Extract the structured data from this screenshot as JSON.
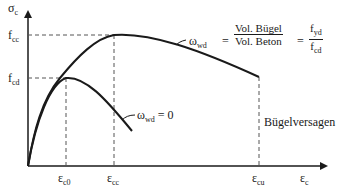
{
  "diagram": {
    "type": "stress-strain curve (confined vs unconfined concrete)",
    "axes": {
      "y_label": "σ",
      "y_label_sub": "c",
      "x_label": "ε",
      "x_label_sub": "c"
    },
    "y_ticks": [
      {
        "label": "f",
        "sub": "cc"
      },
      {
        "label": "f",
        "sub": "cd"
      }
    ],
    "x_ticks": [
      {
        "label": "ε",
        "sub": "c0"
      },
      {
        "label": "ε",
        "sub": "cc"
      },
      {
        "label": "ε",
        "sub": "cu"
      }
    ],
    "curves": [
      {
        "name": "confined",
        "label_symbol": "ω",
        "label_sub": "wd",
        "equals": "=",
        "fraction1_num": "Vol. Bügel",
        "fraction1_den": "Vol. Beton",
        "equals2": "=",
        "fraction2_num_main": "f",
        "fraction2_num_sub": "yd",
        "fraction2_den_main": "f",
        "fraction2_den_sub": "cd"
      },
      {
        "name": "unconfined",
        "label_symbol": "ω",
        "label_sub": "wd",
        "value": "= 0"
      }
    ],
    "annotation": "Bügelversagen",
    "colors": {
      "line": "#1a1a1a",
      "dashed": "#555555",
      "background": "#ffffff"
    }
  }
}
